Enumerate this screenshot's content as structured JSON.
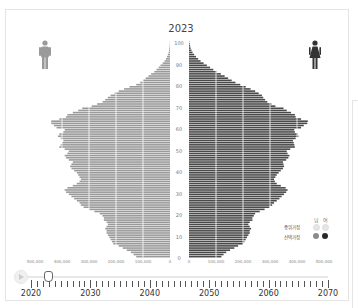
{
  "chart_data": {
    "type": "bar",
    "subtype": "population-pyramid",
    "title": "2023",
    "xlabel": "",
    "ylabel": "",
    "age_ticks": [
      0,
      10,
      20,
      30,
      40,
      50,
      60,
      70,
      80,
      90,
      100
    ],
    "x_ticks_left": [
      "500,000",
      "400,000",
      "300,000",
      "200,000",
      "100,000",
      "0"
    ],
    "x_ticks_right": [
      "0",
      "100,000",
      "200,000",
      "300,000",
      "400,000",
      "500,000"
    ],
    "xlim": [
      0,
      500000
    ],
    "ylim": [
      0,
      100
    ],
    "grid": true,
    "legend_position": "bottom-right",
    "ages": [
      0,
      1,
      2,
      3,
      4,
      5,
      6,
      7,
      8,
      9,
      10,
      11,
      12,
      13,
      14,
      15,
      16,
      17,
      18,
      19,
      20,
      21,
      22,
      23,
      24,
      25,
      26,
      27,
      28,
      29,
      30,
      31,
      32,
      33,
      34,
      35,
      36,
      37,
      38,
      39,
      40,
      41,
      42,
      43,
      44,
      45,
      46,
      47,
      48,
      49,
      50,
      51,
      52,
      53,
      54,
      55,
      56,
      57,
      58,
      59,
      60,
      61,
      62,
      63,
      64,
      65,
      66,
      67,
      68,
      69,
      70,
      71,
      72,
      73,
      74,
      75,
      76,
      77,
      78,
      79,
      80,
      81,
      82,
      83,
      84,
      85,
      86,
      87,
      88,
      89,
      90,
      91,
      92,
      93,
      94,
      95,
      96,
      97,
      98,
      99,
      100
    ],
    "series": [
      {
        "name": "남",
        "color": "#9a9a9a",
        "values": [
          125000,
          135000,
          145000,
          160000,
          175000,
          190000,
          210000,
          215000,
          220000,
          225000,
          230000,
          235000,
          235000,
          240000,
          235000,
          230000,
          235000,
          245000,
          245000,
          250000,
          260000,
          280000,
          300000,
          320000,
          330000,
          335000,
          345000,
          355000,
          365000,
          375000,
          385000,
          390000,
          380000,
          360000,
          345000,
          335000,
          330000,
          335000,
          340000,
          345000,
          355000,
          365000,
          370000,
          365000,
          360000,
          375000,
          385000,
          390000,
          380000,
          375000,
          390000,
          410000,
          405000,
          400000,
          395000,
          405000,
          415000,
          410000,
          395000,
          390000,
          420000,
          430000,
          440000,
          440000,
          410000,
          385000,
          380000,
          360000,
          340000,
          325000,
          290000,
          270000,
          250000,
          240000,
          230000,
          220000,
          205000,
          190000,
          170000,
          150000,
          125000,
          110000,
          100000,
          90000,
          80000,
          70000,
          58000,
          50000,
          42000,
          35000,
          27000,
          20000,
          15000,
          11000,
          8000,
          5000,
          3500,
          2500,
          1500,
          1000,
          500
        ]
      },
      {
        "name": "여",
        "color": "#4a4a4a",
        "values": [
          120000,
          128000,
          138000,
          152000,
          168000,
          182000,
          200000,
          205000,
          210000,
          215000,
          220000,
          225000,
          225000,
          230000,
          225000,
          220000,
          225000,
          235000,
          235000,
          240000,
          245000,
          262000,
          280000,
          298000,
          308000,
          315000,
          325000,
          335000,
          343000,
          352000,
          360000,
          365000,
          358000,
          340000,
          325000,
          318000,
          315000,
          320000,
          325000,
          332000,
          340000,
          348000,
          352000,
          350000,
          348000,
          360000,
          368000,
          372000,
          365000,
          362000,
          375000,
          392000,
          390000,
          388000,
          385000,
          395000,
          405000,
          402000,
          392000,
          390000,
          415000,
          425000,
          438000,
          440000,
          415000,
          395000,
          392000,
          378000,
          362000,
          350000,
          320000,
          305000,
          290000,
          282000,
          275000,
          270000,
          258000,
          245000,
          228000,
          210000,
          190000,
          172000,
          158000,
          145000,
          132000,
          118000,
          102000,
          90000,
          78000,
          66000,
          54000,
          43000,
          34000,
          26000,
          19000,
          13000,
          9000,
          6000,
          4000,
          2500,
          1200
        ]
      }
    ]
  },
  "header": {
    "year_title": "2023",
    "male_icon": "male-person-icon",
    "female_icon": "female-person-icon"
  },
  "axis": {
    "age_labels": [
      "100",
      "90",
      "80",
      "70",
      "60",
      "50",
      "40",
      "30",
      "20",
      "10",
      "0"
    ],
    "left_ticks": [
      "500,000",
      "400,000",
      "300,000",
      "200,000",
      "100,000",
      "0"
    ],
    "right_ticks": [
      "0",
      "100,000",
      "200,000",
      "300,000",
      "400,000",
      "500,000"
    ]
  },
  "legend": {
    "male_header": "남",
    "female_header": "여",
    "row1_label": "중위가정",
    "row2_label": "선택가정",
    "row1_male_color": "#e6e6e6",
    "row1_female_color": "#e6e6e6",
    "row2_male_color": "#8a8a8a",
    "row2_female_color": "#2a2a2a"
  },
  "timeline": {
    "play_icon": "play-icon",
    "start_year": "2020",
    "labels": [
      "2020",
      "2030",
      "2040",
      "2050",
      "2060",
      "2070"
    ],
    "current_year": "2023"
  },
  "colors": {
    "male_bar": "#9a9a9a",
    "female_bar": "#4a4a4a",
    "grid": "#ffffff"
  }
}
